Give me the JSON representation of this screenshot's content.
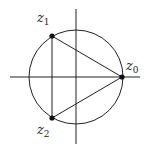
{
  "diagram": {
    "title": "",
    "colors": {
      "stroke": "#222222",
      "background": "#ffffff"
    },
    "axes": {
      "center": [
        76,
        77
      ],
      "x_range": [
        10,
        140
      ],
      "y_range": [
        0,
        145
      ]
    },
    "circle": {
      "cx": 76,
      "cy": 77,
      "r": 47
    },
    "points": [
      {
        "id": "z0",
        "base": "z",
        "subscript": "0",
        "x": 122,
        "y": 77,
        "label_x": 124,
        "label_y": 68
      },
      {
        "id": "z1",
        "base": "z",
        "subscript": "1",
        "x": 52,
        "y": 36,
        "label_x": 37,
        "label_y": 22
      },
      {
        "id": "z2",
        "base": "z",
        "subscript": "2",
        "x": 52,
        "y": 118,
        "label_x": 37,
        "label_y": 134
      }
    ]
  }
}
